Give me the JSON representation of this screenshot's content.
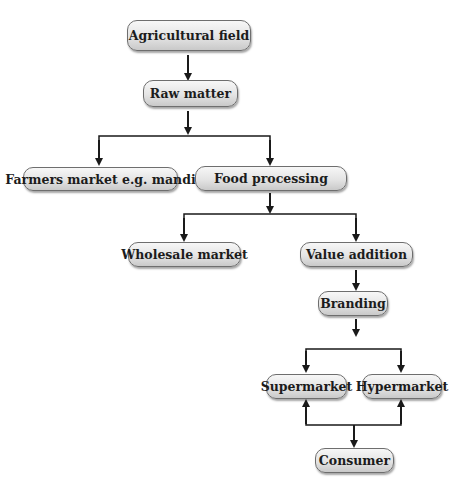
{
  "nodes": {
    "agricultural_field": "Agricultural field",
    "raw_matter": "Raw matter",
    "farmers_market": "Farmers market e.g. mandi",
    "food_processing": "Food processing",
    "wholesale_market": "Wholesale market",
    "value_addition": "Value addition",
    "branding": "Branding",
    "supermarket": "Supermarket",
    "hypermarket": "Hypermarket",
    "consumer": "Consumer"
  },
  "edges": [
    {
      "from": "Agricultural field",
      "to": "Raw matter"
    },
    {
      "from": "Raw matter",
      "to": "Farmers market e.g. mandi"
    },
    {
      "from": "Raw matter",
      "to": "Food processing"
    },
    {
      "from": "Food processing",
      "to": "Wholesale market"
    },
    {
      "from": "Food processing",
      "to": "Value addition"
    },
    {
      "from": "Value addition",
      "to": "Branding"
    },
    {
      "from": "Branding",
      "to": "Supermarket"
    },
    {
      "from": "Branding",
      "to": "Hypermarket"
    },
    {
      "from": "Consumer",
      "to": "Supermarket"
    },
    {
      "from": "Consumer",
      "to": "Hypermarket"
    }
  ],
  "colors": {
    "box_border": "#6e6e6e",
    "box_fill_top": "#f7f7f7",
    "box_fill_bottom": "#c9c9c9",
    "arrow": "#1a1a1a"
  }
}
